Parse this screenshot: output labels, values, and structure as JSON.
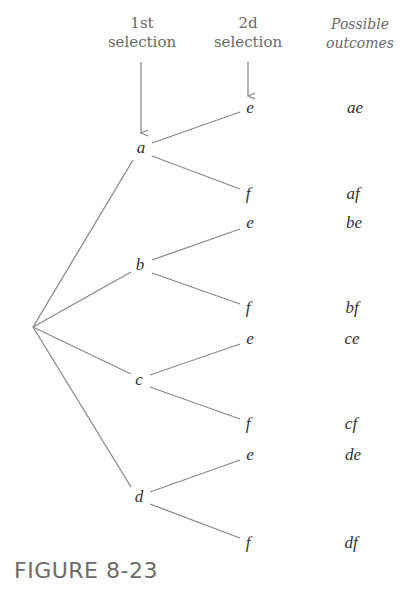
{
  "headers": {
    "first": {
      "line1": "1st",
      "line2": "selection"
    },
    "second": {
      "line1": "2d",
      "line2": "selection"
    },
    "outcomes": {
      "line1": "Possible",
      "line2": "outcomes"
    }
  },
  "first_level": [
    "a",
    "b",
    "c",
    "d"
  ],
  "second_level": [
    {
      "label": "e"
    },
    {
      "label": "f"
    },
    {
      "label": "e"
    },
    {
      "label": "f"
    },
    {
      "label": "e"
    },
    {
      "label": "f"
    },
    {
      "label": "e"
    },
    {
      "label": "f"
    }
  ],
  "outcomes": [
    "ae",
    "af",
    "be",
    "bf",
    "ce",
    "cf",
    "de",
    "df"
  ],
  "figure_label": "FIGURE 8-23",
  "colors": {
    "line": "#8a8a8a",
    "text": "#333333",
    "header": "#6a6a6a"
  }
}
